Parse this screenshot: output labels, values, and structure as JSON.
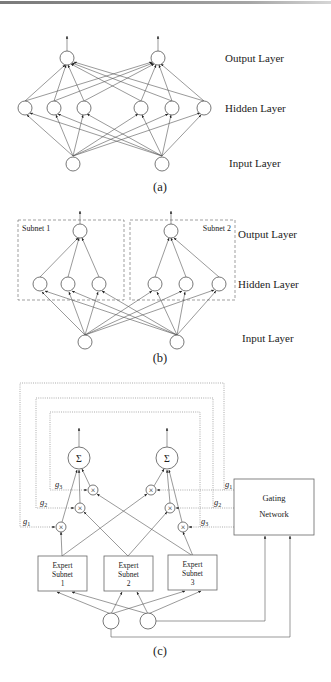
{
  "figure": {
    "panel_a": {
      "caption": "(a)",
      "labels": {
        "output": "Output Layer",
        "hidden": "Hidden Layer",
        "input": "Input Layer"
      }
    },
    "panel_b": {
      "caption": "(b)",
      "subnet_labels": [
        "Subnet 1",
        "Subnet 2"
      ],
      "labels": {
        "output": "Output Layer",
        "hidden": "Hidden Layer",
        "input": "Input Layer"
      }
    },
    "panel_c": {
      "caption": "(c)",
      "sum_symbol": "Σ",
      "mult_symbol": "×",
      "experts": [
        {
          "line1": "Expert",
          "line2": "Subnet",
          "line3": "1"
        },
        {
          "line1": "Expert",
          "line2": "Subnet",
          "line3": "2"
        },
        {
          "line1": "Expert",
          "line2": "Subnet",
          "line3": "3"
        }
      ],
      "gating": {
        "line1": "Gating",
        "line2": "Network"
      },
      "gate_labels_left": [
        "g1",
        "g2",
        "g3"
      ],
      "gate_labels_right": [
        "g1",
        "g2",
        "g3"
      ]
    }
  }
}
